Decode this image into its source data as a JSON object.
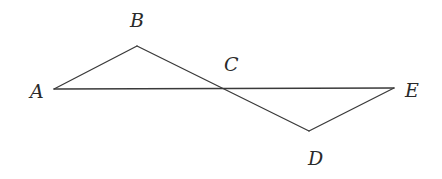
{
  "figure": {
    "width": 442,
    "height": 179,
    "line_color": "#3a3a3a",
    "label_color": "#2a2a2a",
    "points": {
      "A": {
        "label": "A",
        "x": 54,
        "y": 89,
        "label_x": 30,
        "label_y": 98
      },
      "B": {
        "label": "B",
        "x": 137,
        "y": 46,
        "label_x": 130,
        "label_y": 27
      },
      "C": {
        "label": "C",
        "x": 222,
        "y": 89,
        "label_x": 224,
        "label_y": 71
      },
      "D": {
        "label": "D",
        "x": 309,
        "y": 131,
        "label_x": 308,
        "label_y": 165
      },
      "E": {
        "label": "E",
        "x": 394,
        "y": 88,
        "label_x": 405,
        "label_y": 97
      }
    },
    "segments": [
      {
        "name": "segment-AE",
        "from": "A",
        "to": "E"
      },
      {
        "name": "segment-AB",
        "from": "A",
        "to": "B"
      },
      {
        "name": "segment-BD",
        "from": "B",
        "to": "D"
      },
      {
        "name": "segment-DE",
        "from": "D",
        "to": "E"
      }
    ]
  }
}
